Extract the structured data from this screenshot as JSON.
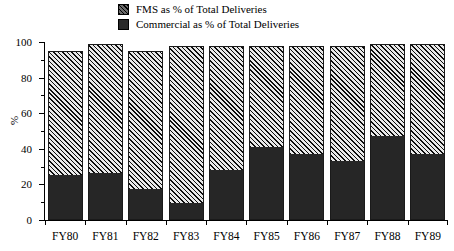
{
  "chart_data": {
    "type": "bar",
    "subtype": "stacked-bar",
    "title": "",
    "xlabel": "",
    "ylabel": "%",
    "ylim": [
      0,
      100
    ],
    "y_major_ticks": [
      0,
      20,
      40,
      60,
      80,
      100
    ],
    "y_minor_ticks": [
      10,
      30,
      50,
      70,
      90
    ],
    "grid": false,
    "legend_position": "top-center",
    "categories": [
      "FY80",
      "FY81",
      "FY82",
      "FY83",
      "FY84",
      "FY85",
      "FY86",
      "FY87",
      "FY88",
      "FY89"
    ],
    "series": [
      {
        "name": "Commercial as % of Total Deliveries",
        "fill": "solid-dark",
        "color": "#262626",
        "values": [
          25,
          26,
          17,
          9,
          28,
          41,
          37,
          33,
          47,
          37
        ]
      },
      {
        "name": "FMS as % of Total Deliveries",
        "fill": "diagonal-hatch",
        "color": "#707070",
        "values": [
          70,
          73,
          78,
          89,
          70,
          57,
          61,
          65,
          52,
          62
        ]
      }
    ],
    "totals": [
      95,
      99,
      95,
      98,
      98,
      98,
      98,
      98,
      99,
      99
    ]
  },
  "legend": {
    "items": [
      {
        "label": "FMS as % of Total Deliveries",
        "swatch": "hatched-swatch-icon"
      },
      {
        "label": "Commercial as % of Total Deliveries",
        "swatch": "solid-swatch-icon"
      }
    ]
  },
  "axes": {
    "y": {
      "title": "%",
      "major_labels": [
        "100",
        "80",
        "60",
        "40",
        "20",
        "0"
      ]
    },
    "x": {
      "labels": [
        "FY80",
        "FY81",
        "FY82",
        "FY83",
        "FY84",
        "FY85",
        "FY86",
        "FY87",
        "FY88",
        "FY89"
      ]
    }
  },
  "colors": {
    "axis": "#000000",
    "background": "#ffffff",
    "commercial": "#262626",
    "fms": "#707070"
  }
}
